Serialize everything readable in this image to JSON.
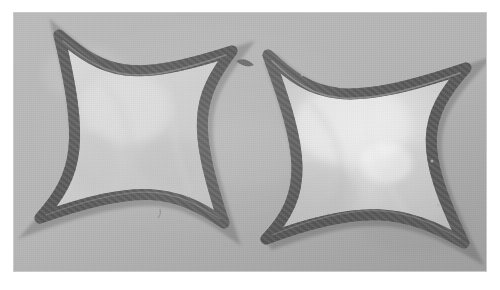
{
  "image": {
    "kind": "photograph",
    "subject": "two four-pointed concave star (astroid) shapes",
    "medium": "black and white photographic print",
    "caption": "",
    "alt_text": "Grayscale photograph of two four-pointed concave star shapes outlined by thick dark curved bands with pale interiors on a flat gray background"
  },
  "frame": {
    "border_color": "#ffffff",
    "print_left": 14,
    "print_top": 13,
    "print_width": 472,
    "print_height": 258
  },
  "palette": {
    "paper_white": "#ffffff",
    "background_gray": "#b5b5b5",
    "background_gray_light": "#bdbdbd",
    "band_dark": "#5e5e5e",
    "band_mid": "#6f6f6f",
    "band_shadow": "#4c4c4c",
    "band_highlight": "#9a9a9a",
    "interior_light": "#cfcfcf",
    "interior_bright": "#e2e2e2",
    "interior_shadow": "#bcbcbc"
  },
  "objects": [
    {
      "name": "left-star",
      "label": "Left four-pointed star",
      "center_x": 130,
      "center_y": 118,
      "radius_x": 104,
      "radius_y": 104,
      "band_thickness": 11,
      "tips": [
        {
          "name": "tip-top-left",
          "x": 45,
          "y": 22
        },
        {
          "name": "tip-top-right",
          "x": 218,
          "y": 38
        },
        {
          "name": "tip-bottom-right",
          "x": 210,
          "y": 210
        },
        {
          "name": "tip-bottom-left",
          "x": 26,
          "y": 205
        }
      ],
      "interior_fill": "#cfcfcf"
    },
    {
      "name": "right-star",
      "label": "Right four-pointed star",
      "center_x": 352,
      "center_y": 128,
      "radius_x": 108,
      "radius_y": 108,
      "band_thickness": 11,
      "tips": [
        {
          "name": "tip-top-left",
          "x": 254,
          "y": 42
        },
        {
          "name": "tip-top-right",
          "x": 452,
          "y": 55
        },
        {
          "name": "tip-bottom-right",
          "x": 450,
          "y": 230
        },
        {
          "name": "tip-bottom-left",
          "x": 252,
          "y": 226
        }
      ],
      "interior_fill": "#d4d4d4"
    }
  ]
}
